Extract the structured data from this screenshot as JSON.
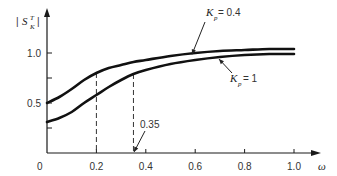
{
  "chart_data": {
    "type": "line",
    "title": "",
    "xlabel": "ω",
    "ylabel": "|S_K^T|",
    "ylabel_main": "S",
    "ylabel_sub": "K",
    "ylabel_sup": "T",
    "xlim": [
      0,
      1.0
    ],
    "ylim": [
      0,
      1.0
    ],
    "grid": false,
    "x_ticks": [
      0.2,
      0.4,
      0.6,
      0.8,
      1.0
    ],
    "x_tick_labels": [
      "0.2",
      "0.4",
      "0.6",
      "0.8",
      "1.0"
    ],
    "origin_label": "0",
    "y_ticks": [
      0.25,
      0.5,
      0.75,
      1.0
    ],
    "y_tick_labels": [
      "",
      "0.5",
      "",
      "1.0"
    ],
    "series": [
      {
        "name": "Kp = 0.4",
        "label_main": "K",
        "label_sub": "p",
        "label_rest": " = 0.4",
        "x": [
          0,
          0.05,
          0.1,
          0.15,
          0.2,
          0.25,
          0.3,
          0.35,
          0.4,
          0.5,
          0.6,
          0.7,
          0.8,
          0.9,
          1.0
        ],
        "values": [
          0.5,
          0.56,
          0.64,
          0.73,
          0.8,
          0.85,
          0.88,
          0.91,
          0.93,
          0.97,
          1.0,
          1.02,
          1.03,
          1.04,
          1.04
        ]
      },
      {
        "name": "Kp = 1",
        "label_main": "K",
        "label_sub": "p",
        "label_rest": " = 1",
        "x": [
          0,
          0.05,
          0.1,
          0.15,
          0.2,
          0.25,
          0.3,
          0.35,
          0.4,
          0.5,
          0.6,
          0.7,
          0.8,
          0.9,
          1.0
        ],
        "values": [
          0.31,
          0.35,
          0.41,
          0.5,
          0.58,
          0.66,
          0.73,
          0.79,
          0.83,
          0.89,
          0.93,
          0.96,
          0.98,
          0.99,
          0.99
        ]
      }
    ],
    "annotations": [
      {
        "type": "dashed-vertical",
        "x": 0.2,
        "from_series": "Kp = 0.4"
      },
      {
        "type": "dashed-vertical",
        "x": 0.35,
        "from_series": "Kp = 1"
      },
      {
        "type": "arrow-label",
        "text": "0.35",
        "points_to_x": 0.35
      }
    ]
  }
}
